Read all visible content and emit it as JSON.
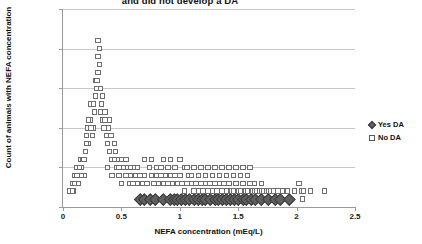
{
  "chart_data": {
    "type": "scatter",
    "title": "and did not develop a DA",
    "xlabel": "NEFA concentration (mEq/L)",
    "ylabel": "Count of animals with NEFA concentration",
    "xlim": [
      0,
      2.5
    ],
    "ylim": [
      0,
      25
    ],
    "xticks": [
      0,
      0.5,
      1,
      1.5,
      2,
      2.5
    ],
    "xtick_labels": [
      "0",
      "0.5",
      "1",
      "1.5",
      "2",
      "2.5"
    ],
    "yticks": [
      0,
      5,
      10,
      15,
      20,
      25
    ],
    "ytick_labels": [
      "0",
      "5",
      "10",
      "15",
      "20",
      "25"
    ],
    "grid": "horizontal",
    "legend_position": "right",
    "series": [
      {
        "name": "Yes DA",
        "marker": "filled-diamond",
        "color": "#5f5f5f",
        "points": [
          [
            0.66,
            1
          ],
          [
            0.7,
            1
          ],
          [
            0.75,
            1
          ],
          [
            0.79,
            1
          ],
          [
            0.86,
            1
          ],
          [
            0.92,
            1
          ],
          [
            0.95,
            1
          ],
          [
            0.98,
            1
          ],
          [
            1.01,
            1
          ],
          [
            1.05,
            1
          ],
          [
            1.08,
            1
          ],
          [
            1.12,
            1
          ],
          [
            1.16,
            1
          ],
          [
            1.19,
            1
          ],
          [
            1.22,
            1
          ],
          [
            1.26,
            1
          ],
          [
            1.3,
            1
          ],
          [
            1.33,
            1
          ],
          [
            1.36,
            1
          ],
          [
            1.4,
            1
          ],
          [
            1.43,
            1
          ],
          [
            1.47,
            1
          ],
          [
            1.5,
            1
          ],
          [
            1.54,
            1
          ],
          [
            1.57,
            1
          ],
          [
            1.61,
            1
          ],
          [
            1.65,
            1
          ],
          [
            1.7,
            1
          ],
          [
            1.76,
            1
          ],
          [
            1.82,
            1
          ],
          [
            1.86,
            1
          ],
          [
            1.94,
            1
          ]
        ]
      },
      {
        "name": "No DA",
        "marker": "open-square",
        "color": "#ffffff",
        "points": [
          [
            0.06,
            2
          ],
          [
            0.08,
            3
          ],
          [
            0.09,
            2
          ],
          [
            0.1,
            4
          ],
          [
            0.12,
            5
          ],
          [
            0.13,
            3
          ],
          [
            0.14,
            4
          ],
          [
            0.15,
            6
          ],
          [
            0.16,
            5
          ],
          [
            0.17,
            6
          ],
          [
            0.18,
            4
          ],
          [
            0.19,
            7
          ],
          [
            0.2,
            9
          ],
          [
            0.21,
            10
          ],
          [
            0.22,
            8
          ],
          [
            0.23,
            11
          ],
          [
            0.24,
            13
          ],
          [
            0.25,
            9
          ],
          [
            0.26,
            10
          ],
          [
            0.27,
            12
          ],
          [
            0.28,
            16
          ],
          [
            0.29,
            15
          ],
          [
            0.3,
            21
          ],
          [
            0.31,
            20
          ],
          [
            0.32,
            15
          ],
          [
            0.33,
            13
          ],
          [
            0.34,
            11
          ],
          [
            0.35,
            10
          ],
          [
            0.36,
            12
          ],
          [
            0.37,
            9
          ],
          [
            0.38,
            8
          ],
          [
            0.39,
            10
          ],
          [
            0.4,
            7
          ],
          [
            0.41,
            9
          ],
          [
            0.42,
            6
          ],
          [
            0.44,
            8
          ],
          [
            0.45,
            7
          ],
          [
            0.46,
            5
          ],
          [
            0.47,
            6
          ],
          [
            0.48,
            4
          ],
          [
            0.5,
            6
          ],
          [
            0.52,
            5
          ],
          [
            0.54,
            4
          ],
          [
            0.55,
            5
          ],
          [
            0.57,
            3
          ],
          [
            0.58,
            4
          ],
          [
            0.6,
            5
          ],
          [
            0.62,
            4
          ],
          [
            0.64,
            3
          ],
          [
            0.66,
            4
          ],
          [
            0.68,
            3
          ],
          [
            0.7,
            4
          ],
          [
            0.72,
            3
          ],
          [
            0.74,
            5
          ],
          [
            0.76,
            4
          ],
          [
            0.78,
            3
          ],
          [
            0.8,
            4
          ],
          [
            0.82,
            3
          ],
          [
            0.84,
            4
          ],
          [
            0.86,
            3
          ],
          [
            0.88,
            4
          ],
          [
            0.9,
            5
          ],
          [
            0.92,
            4
          ],
          [
            0.94,
            3
          ],
          [
            0.96,
            4
          ],
          [
            0.98,
            3
          ],
          [
            1.0,
            4
          ],
          [
            1.02,
            3
          ],
          [
            1.04,
            2
          ],
          [
            1.06,
            3
          ],
          [
            1.08,
            4
          ],
          [
            1.1,
            3
          ],
          [
            1.12,
            2
          ],
          [
            1.14,
            3
          ],
          [
            1.16,
            2
          ],
          [
            1.18,
            3
          ],
          [
            1.2,
            2
          ],
          [
            1.22,
            3
          ],
          [
            1.24,
            2
          ],
          [
            1.26,
            3
          ],
          [
            1.28,
            2
          ],
          [
            1.3,
            3
          ],
          [
            1.32,
            2
          ],
          [
            1.34,
            3
          ],
          [
            1.36,
            2
          ],
          [
            1.38,
            3
          ],
          [
            1.4,
            2
          ],
          [
            1.42,
            3
          ],
          [
            1.44,
            2
          ],
          [
            1.46,
            2
          ],
          [
            1.48,
            3
          ],
          [
            1.5,
            2
          ],
          [
            1.52,
            2
          ],
          [
            1.54,
            3
          ],
          [
            1.56,
            2
          ],
          [
            1.58,
            2
          ],
          [
            1.6,
            3
          ],
          [
            1.62,
            2
          ],
          [
            1.64,
            2
          ],
          [
            1.66,
            2
          ],
          [
            1.68,
            2
          ],
          [
            1.7,
            2
          ],
          [
            1.72,
            2
          ],
          [
            1.74,
            2
          ],
          [
            1.76,
            2
          ],
          [
            1.78,
            2
          ],
          [
            1.8,
            2
          ],
          [
            1.84,
            2
          ],
          [
            1.88,
            2
          ],
          [
            1.92,
            2
          ],
          [
            1.98,
            2
          ],
          [
            2.02,
            3
          ],
          [
            2.04,
            2
          ],
          [
            2.05,
            1
          ],
          [
            2.06,
            2
          ],
          [
            2.12,
            2
          ],
          [
            2.24,
            2
          ],
          [
            0.38,
            5
          ],
          [
            0.42,
            4
          ],
          [
            0.5,
            3
          ],
          [
            0.6,
            3
          ],
          [
            0.64,
            5
          ],
          [
            0.7,
            6
          ],
          [
            0.76,
            6
          ],
          [
            0.84,
            5
          ],
          [
            0.9,
            3
          ],
          [
            0.96,
            5
          ],
          [
            1.04,
            5
          ],
          [
            1.1,
            4
          ],
          [
            1.16,
            4
          ],
          [
            1.22,
            4
          ],
          [
            1.28,
            4
          ],
          [
            1.34,
            4
          ],
          [
            1.4,
            4
          ],
          [
            1.46,
            4
          ],
          [
            1.52,
            4
          ],
          [
            1.58,
            4
          ],
          [
            1.64,
            3
          ],
          [
            1.7,
            3
          ],
          [
            0.44,
            6
          ],
          [
            0.48,
            5
          ],
          [
            0.54,
            6
          ],
          [
            0.58,
            5
          ],
          [
            0.8,
            5
          ],
          [
            0.86,
            6
          ],
          [
            0.92,
            6
          ],
          [
            1.0,
            6
          ],
          [
            1.06,
            5
          ],
          [
            1.12,
            5
          ],
          [
            1.18,
            5
          ],
          [
            1.24,
            5
          ],
          [
            1.3,
            5
          ],
          [
            1.36,
            5
          ],
          [
            1.42,
            5
          ],
          [
            1.48,
            5
          ],
          [
            1.54,
            5
          ],
          [
            1.6,
            5
          ],
          [
            0.34,
            14
          ],
          [
            0.3,
            17
          ],
          [
            0.28,
            14
          ],
          [
            0.26,
            13
          ],
          [
            0.32,
            12
          ],
          [
            0.36,
            11
          ],
          [
            0.4,
            11
          ],
          [
            0.24,
            10
          ],
          [
            0.22,
            11
          ],
          [
            0.2,
            8
          ],
          [
            0.18,
            6
          ],
          [
            0.16,
            4
          ],
          [
            0.14,
            5
          ],
          [
            0.12,
            4
          ],
          [
            0.1,
            3
          ],
          [
            0.08,
            2
          ],
          [
            0.3,
            19
          ],
          [
            0.31,
            18
          ],
          [
            0.29,
            16
          ]
        ]
      }
    ]
  },
  "legend": {
    "items": [
      {
        "label": "Yes DA",
        "marker": "filled-diamond"
      },
      {
        "label": "No DA",
        "marker": "open-square"
      }
    ]
  }
}
